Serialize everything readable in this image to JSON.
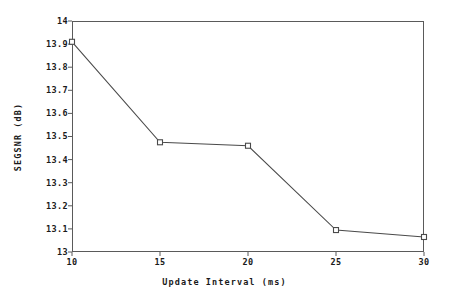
{
  "chart_data": {
    "type": "line",
    "title": "",
    "subtitle": "",
    "xlabel": "Update Interval (ms)",
    "ylabel": "SEGSNR (dB)",
    "x": [
      10,
      15,
      20,
      25,
      30
    ],
    "values": [
      13.91,
      13.475,
      13.46,
      13.095,
      13.065
    ],
    "series": [
      {
        "name": "SEGSNR",
        "x": [
          10,
          15,
          20,
          25,
          30
        ],
        "values": [
          13.91,
          13.475,
          13.46,
          13.095,
          13.065
        ]
      }
    ],
    "xlim": [
      10,
      30
    ],
    "ylim": [
      13,
      14
    ],
    "xticks": [
      10,
      15,
      20,
      25,
      30
    ],
    "xtick_labels": [
      "10",
      "15",
      "20",
      "25",
      "30"
    ],
    "yticks": [
      13,
      13.1,
      13.2,
      13.3,
      13.4,
      13.5,
      13.6,
      13.7,
      13.8,
      13.9,
      14
    ],
    "ytick_labels": [
      "13",
      "13.1",
      "13.2",
      "13.3",
      "13.4",
      "13.5",
      "13.6",
      "13.7",
      "13.8",
      "13.9",
      "14"
    ],
    "grid": false,
    "legend": null,
    "marker": "open-square",
    "line_color": "#4a4a4a",
    "marker_color": "#4a4a4a",
    "axis_color": "#5a5a5a",
    "background": "#ffffff",
    "annotations": []
  }
}
